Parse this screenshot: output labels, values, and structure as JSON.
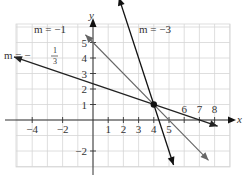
{
  "chart_data": {
    "type": "line",
    "title": "",
    "xlabel": "x",
    "ylabel": "y",
    "xlim": [
      -5,
      8.8
    ],
    "ylim": [
      -3,
      6.2
    ],
    "grid": true,
    "x_ticks": [
      -4,
      -2,
      1,
      2,
      3,
      4,
      5,
      6,
      7,
      8
    ],
    "y_ticks": [
      -2,
      1,
      2,
      3,
      4,
      5
    ],
    "point": {
      "x": 4,
      "y": 1
    },
    "series": [
      {
        "name": "m = -3",
        "slope": -3,
        "through": [
          4,
          1
        ],
        "x_range": [
          1.7,
          5.3
        ],
        "color": "#111111"
      },
      {
        "name": "m = -1",
        "slope": -1,
        "through": [
          4,
          1
        ],
        "x_range": [
          -0.5,
          7.6
        ],
        "color": "#666666"
      },
      {
        "name": "m = -1/3",
        "slope": -0.3333,
        "through": [
          4,
          1
        ],
        "x_range": [
          -5.2,
          8.2
        ],
        "color": "#222222"
      }
    ],
    "annotations": [
      {
        "text": "m = −1",
        "x": -2.6,
        "y": 5.45
      },
      {
        "text": "m = −3",
        "x": 2.3,
        "y": 5.45
      },
      {
        "text": "m = −1/3",
        "x": -5.5,
        "y": 4.1
      }
    ]
  },
  "labels": {
    "x_axis": "x",
    "y_axis": "y",
    "m1": "m = −1",
    "m3": "m = −3",
    "m13_prefix": "m = −",
    "m13_num": "1",
    "m13_den": "3"
  }
}
